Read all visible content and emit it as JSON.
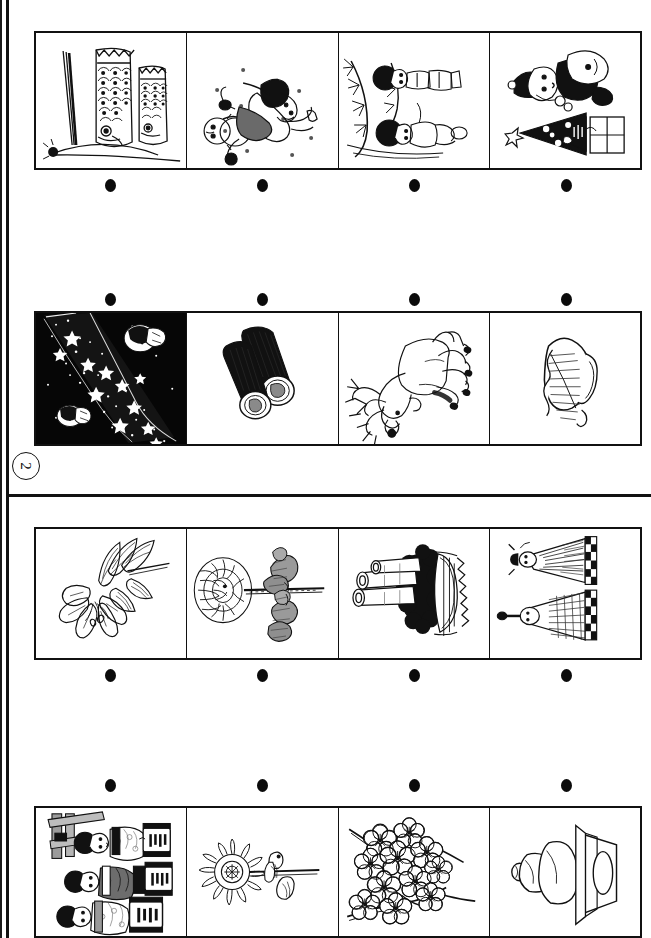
{
  "worksheet": {
    "orientation": "rotated-90",
    "question_number": "2",
    "ink_color": "#111111",
    "paper_color": "#ffffff"
  },
  "sections": [
    {
      "id": "section-1",
      "rows": [
        {
          "id": "row-1",
          "dots_position": "below",
          "panels": [
            {
              "id": "r1c1",
              "subject": "koinobori-carp-streamers",
              "background": "white"
            },
            {
              "id": "r1c2",
              "subject": "child-playing-in-snow-with-snowman",
              "background": "white"
            },
            {
              "id": "r1c3",
              "subject": "children-with-bamboo-tanabata",
              "background": "white"
            },
            {
              "id": "r1c4",
              "subject": "santa-claus-with-christmas-tree-and-gift",
              "background": "white"
            }
          ]
        },
        {
          "id": "row-2",
          "dots_position": "above",
          "panels": [
            {
              "id": "r2c1",
              "subject": "milky-way-night-sky-orihime-hikoboshi",
              "background": "black"
            },
            {
              "id": "r2c2",
              "subject": "ehomaki-sushi-rolls",
              "background": "white"
            },
            {
              "id": "r2c3",
              "subject": "reindeer",
              "background": "white"
            },
            {
              "id": "r2c4",
              "subject": "kashiwa-mochi-oak-leaf-rice-cake",
              "background": "white"
            }
          ]
        }
      ]
    },
    {
      "id": "section-2",
      "rows": [
        {
          "id": "row-3",
          "dots_position": "below",
          "panels": [
            {
              "id": "r3c1",
              "subject": "lily-flower",
              "background": "white"
            },
            {
              "id": "r3c2",
              "subject": "chrysanthemum-with-chestnuts",
              "background": "white"
            },
            {
              "id": "r3c3",
              "subject": "kadomatsu-new-year-decoration",
              "background": "white"
            },
            {
              "id": "r3c4",
              "subject": "hina-dolls",
              "background": "white"
            }
          ]
        },
        {
          "id": "row-4",
          "dots_position": "above",
          "panels": [
            {
              "id": "r4c1",
              "subject": "children-in-yukata-with-lanterns",
              "background": "white"
            },
            {
              "id": "r4c2",
              "subject": "sunflower-with-insect",
              "background": "white"
            },
            {
              "id": "r4c3",
              "subject": "plum-blossom-branch",
              "background": "white"
            },
            {
              "id": "r4c4",
              "subject": "kagami-mochi",
              "background": "white"
            }
          ]
        }
      ]
    }
  ]
}
